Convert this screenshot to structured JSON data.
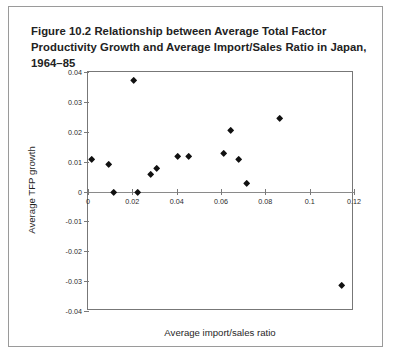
{
  "figure": {
    "title": "Figure 10.2 Relationship between Average Total Factor Productivity Growth and Average Import/Sales Ratio in Japan, 1964–85"
  },
  "chart_data": {
    "type": "scatter",
    "title": "Figure 10.2 Relationship between Average Total Factor Productivity Growth and Average Import/Sales Ratio in Japan, 1964–85",
    "xlabel": "Average import/sales ratio",
    "ylabel": "Average TFP growth",
    "xlim": [
      0,
      0.12
    ],
    "ylim": [
      -0.04,
      0.04
    ],
    "xticks": [
      0,
      0.02,
      0.04,
      0.06,
      0.08,
      0.1,
      0.12
    ],
    "xtick_labels": [
      "0",
      "0.02",
      "0.04",
      "0.06",
      "0.08",
      "0.1",
      "0.12"
    ],
    "yticks": [
      0.04,
      0.03,
      0.02,
      0.01,
      0,
      -0.01,
      -0.02,
      -0.03,
      -0.04
    ],
    "ytick_labels": [
      "0.04",
      "0.03",
      "0.02",
      "0.01",
      "0",
      "-0.01",
      "-0.02",
      "-0.03",
      "-0.04"
    ],
    "grid": false,
    "legend": false,
    "marker": "diamond",
    "marker_color": "#111111",
    "zero_line": 0,
    "series": [
      {
        "name": "Japanese industries, 1964–85",
        "points": [
          {
            "x": 0.0015,
            "y": 0.0105
          },
          {
            "x": 0.0095,
            "y": 0.009
          },
          {
            "x": 0.0115,
            "y": -0.0005
          },
          {
            "x": 0.0205,
            "y": 0.0372
          },
          {
            "x": 0.0225,
            "y": -0.0005
          },
          {
            "x": 0.0285,
            "y": 0.0055
          },
          {
            "x": 0.031,
            "y": 0.0075
          },
          {
            "x": 0.0405,
            "y": 0.0115
          },
          {
            "x": 0.0455,
            "y": 0.0115
          },
          {
            "x": 0.061,
            "y": 0.0125
          },
          {
            "x": 0.0645,
            "y": 0.0205
          },
          {
            "x": 0.068,
            "y": 0.0105
          },
          {
            "x": 0.0715,
            "y": 0.0025
          },
          {
            "x": 0.0865,
            "y": 0.0245
          },
          {
            "x": 0.1145,
            "y": -0.0315
          }
        ]
      }
    ]
  }
}
